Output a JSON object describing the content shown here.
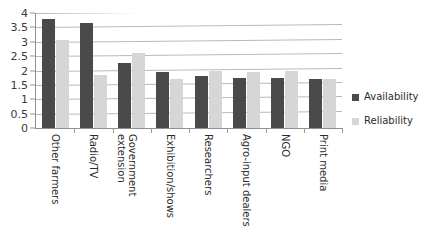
{
  "chart_data": {
    "type": "bar",
    "title": "",
    "subtitle": "",
    "xlabel": "",
    "ylabel": "",
    "ylim": [
      0,
      4
    ],
    "ytick_step": 0.5,
    "yticks": [
      "0",
      "0.5",
      "1",
      "1.5",
      "2",
      "2.5",
      "3",
      "3.5",
      "4"
    ],
    "grid": true,
    "grid_orientation": "horizontal",
    "legend_position": "right",
    "categories": [
      "Other farmers",
      "Radio/TV",
      "Government extension",
      "Exhibition/shows",
      "Researchers",
      "Agro-input dealers",
      "NGO",
      "Print media"
    ],
    "series": [
      {
        "name": "Availability",
        "color": "#4a4a4a",
        "values": [
          3.8,
          3.65,
          2.25,
          1.95,
          1.8,
          1.75,
          1.75,
          1.7
        ]
      },
      {
        "name": "Reliability",
        "color": "#d6d6d6",
        "values": [
          3.05,
          1.85,
          2.6,
          1.7,
          2.0,
          1.95,
          2.0,
          1.7
        ]
      }
    ]
  }
}
